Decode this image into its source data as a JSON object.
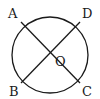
{
  "diagram": {
    "type": "geometry",
    "circle": {
      "center": "O",
      "cx": 50,
      "cy": 55,
      "r": 38
    },
    "points": [
      {
        "name": "A",
        "label": "A",
        "x": 22,
        "y": 27
      },
      {
        "name": "D",
        "label": "D",
        "x": 79,
        "y": 27
      },
      {
        "name": "B",
        "label": "B",
        "x": 22,
        "y": 83
      },
      {
        "name": "C",
        "label": "C",
        "x": 79,
        "y": 83
      },
      {
        "name": "O",
        "label": "O",
        "x": 50,
        "y": 55
      }
    ],
    "segments": [
      {
        "from": "A",
        "to": "C"
      },
      {
        "from": "D",
        "to": "B"
      }
    ],
    "labels": {
      "A": "A",
      "B": "B",
      "C": "C",
      "D": "D",
      "O": "O"
    },
    "stroke_color": "#1a1a1a"
  }
}
